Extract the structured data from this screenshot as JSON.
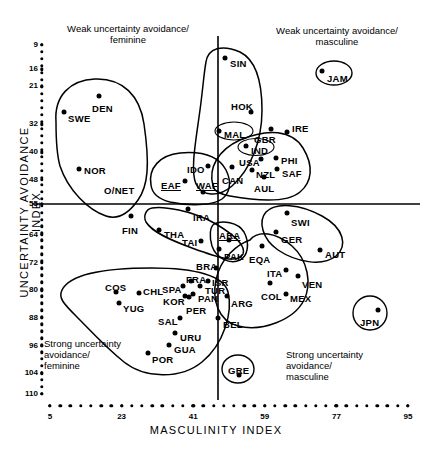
{
  "chart_data": {
    "type": "scatter",
    "title": "",
    "xlabel": "MASCULINITY INDEX",
    "ylabel": "UNCERTAINTY AVOIDANCE INDEX",
    "xlim": [
      5,
      95
    ],
    "ylim": [
      9,
      110
    ],
    "y_inverted": true,
    "grid": false,
    "legend": "none",
    "xticks": [
      5,
      23,
      41,
      59,
      77,
      95
    ],
    "yticks": [
      9,
      16,
      21,
      32,
      40,
      48,
      55,
      64,
      72,
      80,
      88,
      96,
      104,
      110
    ],
    "crosshair": {
      "x": 50,
      "y": 55
    },
    "annotations": [
      {
        "name": "weak-feminine",
        "text": "Weak uncertainty avoidance/\nfeminine",
        "corner": "top-left"
      },
      {
        "name": "weak-masculine",
        "text": "Weak uncertainty avoidance/\nmasculine",
        "corner": "top-right"
      },
      {
        "name": "strong-feminine",
        "text": "Strong uncertainty\navoidance/\nfeminine",
        "corner": "bottom-left"
      },
      {
        "name": "strong-masculine",
        "text": "Strong uncertainty\navoidance/\nmasculine",
        "corner": "bottom-right"
      }
    ],
    "points": [
      {
        "label": "SIN",
        "x": 48,
        "y": 8,
        "px": 225,
        "py": 58,
        "lx": 230,
        "ly": 59,
        "underline": false
      },
      {
        "label": "JAM",
        "x": 68,
        "y": 13,
        "px": 322,
        "py": 71,
        "lx": 327,
        "ly": 74,
        "underline": false,
        "circled": true,
        "cw": 34,
        "ch": 22
      },
      {
        "label": "DEN",
        "x": 16,
        "y": 23,
        "px": 99,
        "py": 96,
        "lx": 92,
        "ly": 104,
        "underline": false
      },
      {
        "label": "SWE",
        "x": 5,
        "y": 29,
        "px": 64,
        "py": 112,
        "lx": 68,
        "ly": 114,
        "underline": false
      },
      {
        "label": "HOK",
        "x": 57,
        "y": 29,
        "px": 251,
        "py": 112,
        "lx": 231,
        "ly": 102,
        "underline": false
      },
      {
        "label": "MAL",
        "x": 50,
        "y": 36,
        "px": 219,
        "py": 131,
        "lx": 224,
        "ly": 130,
        "underline": false,
        "circled": true,
        "cw": 36,
        "ch": 17
      },
      {
        "label": "GBR",
        "x": 66,
        "y": 35,
        "px": 271,
        "py": 129,
        "lx": 254,
        "ly": 135,
        "underline": false
      },
      {
        "label": "IRE",
        "x": 68,
        "y": 35,
        "px": 287,
        "py": 132,
        "lx": 292,
        "ly": 124,
        "underline": false
      },
      {
        "label": "NOR",
        "x": 8,
        "y": 50,
        "px": 79,
        "py": 169,
        "lx": 84,
        "ly": 166,
        "underline": false
      },
      {
        "label": "IND",
        "x": 56,
        "y": 40,
        "px": 246,
        "py": 146,
        "lx": 251,
        "ly": 146,
        "underline": false,
        "circled": true,
        "cw": 33,
        "ch": 16
      },
      {
        "label": "USA",
        "x": 62,
        "y": 46,
        "px": 261,
        "py": 159,
        "lx": 239,
        "ly": 158,
        "underline": false
      },
      {
        "label": "PHI",
        "x": 64,
        "y": 44,
        "px": 276,
        "py": 158,
        "lx": 281,
        "ly": 156,
        "underline": false
      },
      {
        "label": "IDO",
        "x": 46,
        "y": 48,
        "px": 208,
        "py": 166,
        "lx": 187,
        "ly": 165,
        "underline": false
      },
      {
        "label": "EAF",
        "x": 41,
        "y": 52,
        "px": 185,
        "py": 181,
        "lx": 161,
        "ly": 181,
        "underline": true
      },
      {
        "label": "WAF",
        "x": 46,
        "y": 54,
        "px": 203,
        "py": 192,
        "lx": 196,
        "ly": 181,
        "underline": true
      },
      {
        "label": "NZL",
        "x": 58,
        "y": 49,
        "px": 252,
        "py": 170,
        "lx": 256,
        "ly": 170,
        "underline": false
      },
      {
        "label": "SAF",
        "x": 63,
        "y": 49,
        "px": 277,
        "py": 169,
        "lx": 282,
        "ly": 169,
        "underline": false
      },
      {
        "label": "CAN",
        "x": 52,
        "y": 48,
        "px": 232,
        "py": 167,
        "lx": 222,
        "ly": 176,
        "underline": false
      },
      {
        "label": "AUL",
        "x": 61,
        "y": 51,
        "px": 264,
        "py": 177,
        "lx": 254,
        "ly": 184,
        "underline": false
      },
      {
        "label": "O/NET",
        "x": 14,
        "y": 53,
        "px": 100,
        "py": 191,
        "lx": 104,
        "ly": 186,
        "underline": false,
        "nodot": true
      },
      {
        "label": "IRA",
        "x": 43,
        "y": 59,
        "px": 188,
        "py": 209,
        "lx": 193,
        "ly": 213,
        "underline": false
      },
      {
        "label": "SWI",
        "x": 70,
        "y": 58,
        "px": 287,
        "py": 213,
        "lx": 291,
        "ly": 218,
        "underline": false
      },
      {
        "label": "FIN",
        "x": 26,
        "y": 59,
        "px": 131,
        "py": 216,
        "lx": 122,
        "ly": 226,
        "underline": false
      },
      {
        "label": "GER",
        "x": 66,
        "y": 65,
        "px": 276,
        "py": 232,
        "lx": 281,
        "ly": 235,
        "underline": false
      },
      {
        "label": "THA",
        "x": 34,
        "y": 64,
        "px": 159,
        "py": 230,
        "lx": 164,
        "ly": 230,
        "underline": false
      },
      {
        "label": "TAI",
        "x": 45,
        "y": 69,
        "px": 201,
        "py": 241,
        "lx": 182,
        "ly": 238,
        "underline": false
      },
      {
        "label": "ARA",
        "x": 53,
        "y": 68,
        "px": 229,
        "py": 240,
        "lx": 219,
        "ly": 231,
        "underline": true
      },
      {
        "label": "AUT",
        "x": 79,
        "y": 70,
        "px": 320,
        "py": 250,
        "lx": 325,
        "ly": 250,
        "underline": false
      },
      {
        "label": "PAK",
        "x": 50,
        "y": 70,
        "px": 219,
        "py": 249,
        "lx": 224,
        "ly": 252,
        "underline": false
      },
      {
        "label": "EQA",
        "x": 63,
        "y": 67,
        "px": 262,
        "py": 246,
        "lx": 249,
        "ly": 255,
        "underline": false
      },
      {
        "label": "BRA",
        "x": 49,
        "y": 76,
        "px": 216,
        "py": 268,
        "lx": 196,
        "ly": 262,
        "underline": false
      },
      {
        "label": "ITA",
        "x": 70,
        "y": 75,
        "px": 286,
        "py": 270,
        "lx": 267,
        "ly": 269,
        "underline": false
      },
      {
        "label": "VEN",
        "x": 73,
        "y": 76,
        "px": 298,
        "py": 276,
        "lx": 302,
        "ly": 280,
        "underline": false
      },
      {
        "label": "FRA",
        "x": 43,
        "y": 80,
        "px": 191,
        "py": 281,
        "lx": 186,
        "ly": 275,
        "underline": false
      },
      {
        "label": "ISR",
        "x": 47,
        "y": 80,
        "px": 208,
        "py": 281,
        "lx": 212,
        "ly": 278,
        "underline": false
      },
      {
        "label": "COS",
        "x": 21,
        "y": 82,
        "px": 116,
        "py": 292,
        "lx": 105,
        "ly": 283,
        "underline": false
      },
      {
        "label": "CHL",
        "x": 28,
        "y": 83,
        "px": 139,
        "py": 293,
        "lx": 143,
        "ly": 287,
        "underline": false
      },
      {
        "label": "SPA",
        "x": 42,
        "y": 81,
        "px": 183,
        "py": 286,
        "lx": 162,
        "ly": 285,
        "underline": false
      },
      {
        "label": "TUR",
        "x": 46,
        "y": 82,
        "px": 200,
        "py": 286,
        "lx": 205,
        "ly": 286,
        "underline": false
      },
      {
        "label": "COL",
        "x": 64,
        "y": 81,
        "px": 270,
        "py": 283,
        "lx": 261,
        "ly": 292,
        "underline": false
      },
      {
        "label": "MEX",
        "x": 69,
        "y": 85,
        "px": 286,
        "py": 294,
        "lx": 290,
        "ly": 294,
        "underline": false
      },
      {
        "label": "KOR",
        "x": 39,
        "y": 85,
        "px": 185,
        "py": 296,
        "lx": 163,
        "ly": 297,
        "underline": false
      },
      {
        "label": "PAN",
        "x": 44,
        "y": 85,
        "px": 193,
        "py": 294,
        "lx": 198,
        "ly": 294,
        "underline": false
      },
      {
        "label": "YUG",
        "x": 21,
        "y": 88,
        "px": 119,
        "py": 303,
        "lx": 123,
        "ly": 304,
        "underline": false
      },
      {
        "label": "PER",
        "x": 42,
        "y": 87,
        "px": 189,
        "py": 297,
        "lx": 186,
        "ly": 306,
        "underline": false
      },
      {
        "label": "ARG",
        "x": 56,
        "y": 86,
        "px": 227,
        "py": 296,
        "lx": 231,
        "ly": 299,
        "underline": false
      },
      {
        "label": "SAL",
        "x": 40,
        "y": 94,
        "px": 180,
        "py": 318,
        "lx": 158,
        "ly": 317,
        "underline": false
      },
      {
        "label": "JPN",
        "x": 95,
        "y": 92,
        "px": 378,
        "py": 310,
        "lx": 360,
        "ly": 318,
        "underline": false,
        "circled": true,
        "cw": 32,
        "ch": 32
      },
      {
        "label": "BEL",
        "x": 54,
        "y": 94,
        "px": 218,
        "py": 318,
        "lx": 223,
        "ly": 320,
        "underline": false
      },
      {
        "label": "URU",
        "x": 38,
        "y": 100,
        "px": 175,
        "py": 333,
        "lx": 180,
        "ly": 333,
        "underline": false
      },
      {
        "label": "GUA",
        "x": 37,
        "y": 101,
        "px": 169,
        "py": 345,
        "lx": 174,
        "ly": 345,
        "underline": false
      },
      {
        "label": "POR",
        "x": 31,
        "y": 104,
        "px": 148,
        "py": 353,
        "lx": 152,
        "ly": 355,
        "underline": false
      },
      {
        "label": "GRE",
        "x": 57,
        "y": 107,
        "px": 239,
        "py": 375,
        "lx": 228,
        "ly": 366,
        "underline": false,
        "circled": true,
        "cw": 30,
        "ch": 25
      }
    ]
  }
}
